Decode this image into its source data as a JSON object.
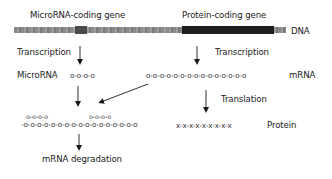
{
  "labels": {
    "mirna_gene": "MicroRNA-coding gene",
    "protein_gene": "Protein-coding gene",
    "dna": "DNA",
    "transcription_left": "Transcription",
    "transcription_right": "Transcription",
    "microrna": "MicroRNA",
    "mrna": "mRNA",
    "translation": "Translation",
    "protein": "Protein",
    "mrna_degradation": "mRNA degradation"
  },
  "sequences": {
    "microrna": "o-o-o-o",
    "mrna": "o-o-o-o-o-o-o-o-o-o-o-o-o-o-o",
    "protein": "x-x-x-x-x-x-x-x-x",
    "duplex_bottom": "-o-o-o-o-o-o-o-o-o-o-o-o-o-o-o-o-o",
    "duplex_top_left": "o-o-o-o",
    "duplex_top_right": "o-o-o-o"
  },
  "colors": {
    "dna_light": "#8c8c8c",
    "dna_dark": "#1e1e1e",
    "arrow": "#1a1a1a"
  }
}
